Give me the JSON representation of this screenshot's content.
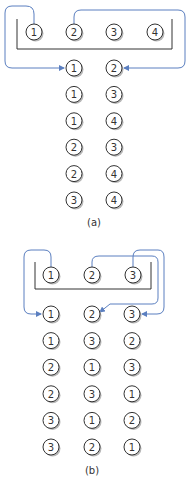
{
  "figures": [
    {
      "id": "a",
      "caption": "(a)",
      "set": [
        "1",
        "2",
        "3",
        "4"
      ],
      "chosen_pairs": [
        [
          "1",
          "2"
        ],
        [
          "1",
          "3"
        ],
        [
          "1",
          "4"
        ],
        [
          "2",
          "3"
        ],
        [
          "2",
          "4"
        ],
        [
          "3",
          "4"
        ]
      ]
    },
    {
      "id": "b",
      "caption": "(b)",
      "set": [
        "1",
        "2",
        "3"
      ],
      "permutations": [
        [
          "1",
          "2",
          "3"
        ],
        [
          "1",
          "3",
          "2"
        ],
        [
          "2",
          "1",
          "3"
        ],
        [
          "2",
          "3",
          "1"
        ],
        [
          "3",
          "1",
          "2"
        ],
        [
          "3",
          "2",
          "1"
        ]
      ]
    }
  ],
  "colors": {
    "arrow": "#5b7fc0",
    "outline": "#333333",
    "shadow": "#b8b8b8"
  }
}
